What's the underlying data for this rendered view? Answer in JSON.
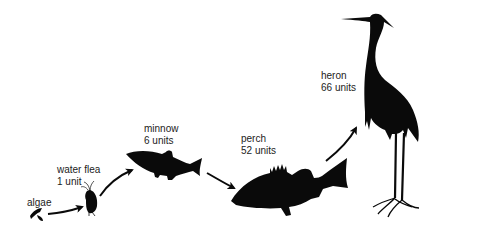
{
  "colors": {
    "silhouette": "#0a0a0a",
    "text": "#222222",
    "background": "#ffffff"
  },
  "organisms": [
    {
      "name": "algae",
      "amount": ""
    },
    {
      "name": "water flea",
      "amount": "1 unit"
    },
    {
      "name": "minnow",
      "amount": "6 units"
    },
    {
      "name": "perch",
      "amount": "52 units"
    },
    {
      "name": "heron",
      "amount": "66 units"
    }
  ]
}
